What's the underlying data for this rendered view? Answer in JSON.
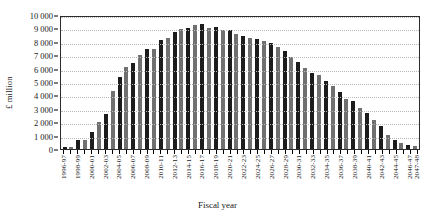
{
  "chart_data": {
    "type": "bar",
    "title": "",
    "xlabel": "Fiscal year",
    "ylabel": "£ million",
    "ylim": [
      0,
      10000
    ],
    "ytick_labels": [
      "0",
      "1 000",
      "2 000",
      "3 000",
      "4 000",
      "5 000",
      "6 000",
      "7 000",
      "8 000",
      "9 000",
      "10 000"
    ],
    "ytick_values": [
      0,
      1000,
      2000,
      3000,
      4000,
      5000,
      6000,
      7000,
      8000,
      9000,
      10000
    ],
    "grid": true,
    "legend": "none",
    "categories": [
      "1996-97",
      "1997-98",
      "1998-99",
      "1999-00",
      "2000-01",
      "2001-02",
      "2002-03",
      "2003-04",
      "2004-05",
      "2005-06",
      "2006-07",
      "2007-08",
      "2008-09",
      "2009-10",
      "2010-11",
      "2011-12",
      "2012-13",
      "2013-14",
      "2014-15",
      "2015-16",
      "2016-17",
      "2017-18",
      "2018-19",
      "2019-20",
      "2020-21",
      "2021-22",
      "2022-23",
      "2023-24",
      "2024-25",
      "2025-26",
      "2026-27",
      "2027-28",
      "2028-29",
      "2029-30",
      "2030-31",
      "2031-32",
      "2032-33",
      "2033-34",
      "2034-35",
      "2035-36",
      "2036-37",
      "2037-38",
      "2038-39",
      "2039-40",
      "2040-41",
      "2041-42",
      "2042-43",
      "2043-44",
      "2044-45",
      "2045-46",
      "2046-47",
      "2047-48"
    ],
    "tick_labels_shown": [
      "1996-97",
      "1998-99",
      "2000-01",
      "2002-03",
      "2004-05",
      "2006-07",
      "2008-09",
      "2010-11",
      "2012-13",
      "2014-15",
      "2016-17",
      "2018-19",
      "2020-21",
      "2022-23",
      "2024-25",
      "2026-27",
      "2028-29",
      "2030-31",
      "2032-33",
      "2034-35",
      "2036-37",
      "2038-39",
      "2040-41",
      "2042-43",
      "2044-45",
      "2046-47",
      "2047-48"
    ],
    "values": [
      120,
      180,
      640,
      700,
      1280,
      2000,
      2620,
      4360,
      5350,
      6100,
      6450,
      7050,
      7500,
      7450,
      8150,
      8300,
      8700,
      8950,
      9050,
      9250,
      9300,
      9000,
      9100,
      8900,
      8850,
      8600,
      8450,
      8300,
      8200,
      8050,
      7900,
      7600,
      7300,
      6850,
      6500,
      6050,
      5650,
      5500,
      5100,
      4700,
      4250,
      3700,
      3550,
      3050,
      2700,
      2150,
      1750,
      1050,
      700,
      470,
      300,
      260
    ],
    "bar_colors": [
      "#1c1c1c",
      "#707070"
    ],
    "bar_color_pattern": "alternating dark and gray"
  }
}
